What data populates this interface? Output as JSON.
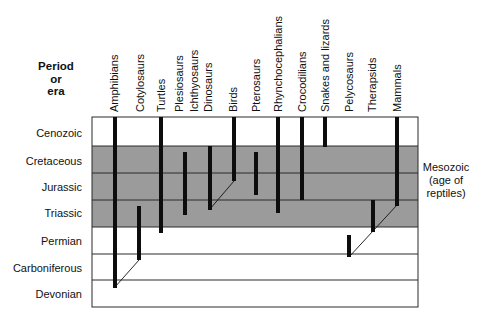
{
  "header": {
    "lines": [
      "Period",
      "or",
      "era"
    ]
  },
  "colors": {
    "mesozoic_band": "#9b9b9b",
    "grid_line": "#2a2a2a",
    "bar": "#0d0d0d",
    "background": "#ffffff"
  },
  "periods": [
    {
      "name": "Cenozoic",
      "y_center": 133
    },
    {
      "name": "Cretaceous",
      "y_center": 161
    },
    {
      "name": "Jurassic",
      "y_center": 187
    },
    {
      "name": "Triassic",
      "y_center": 213
    },
    {
      "name": "Permian",
      "y_center": 241
    },
    {
      "name": "Carboniferous",
      "y_center": 268
    },
    {
      "name": "Devonian",
      "y_center": 294
    }
  ],
  "era_annotation": {
    "lines": [
      "Mesozoic",
      "(age of",
      "reptiles)"
    ],
    "spans_periods": [
      "Cretaceous",
      "Jurassic",
      "Triassic"
    ]
  },
  "taxa": [
    {
      "name": "Amphibians",
      "x": 115,
      "from": "Devonian",
      "to": "Cenozoic (present)"
    },
    {
      "name": "Cotylosaurs",
      "x": 139,
      "from": "Carboniferous",
      "to": "Triassic"
    },
    {
      "name": "Turtles",
      "x": 161,
      "from": "Permian",
      "to": "Cenozoic (present)"
    },
    {
      "name": "Plesiosaurs",
      "x": 178,
      "from": "",
      "to": ""
    },
    {
      "name": "Ichthyosaurs",
      "x": 185,
      "from": "Triassic",
      "to": "Cretaceous"
    },
    {
      "name": "Dinosaurs",
      "x": 210,
      "from": "Triassic",
      "to": "Cretaceous"
    },
    {
      "name": "Birds",
      "x": 234,
      "from": "Jurassic",
      "to": "Cenozoic (present)"
    },
    {
      "name": "Pterosaurs",
      "x": 256,
      "from": "Jurassic",
      "to": "Cretaceous"
    },
    {
      "name": "Rhynchocephalians",
      "x": 278,
      "from": "Triassic",
      "to": "Cenozoic (present)"
    },
    {
      "name": "Crocodilians",
      "x": 302,
      "from": "Jurassic",
      "to": "Cenozoic (present)"
    },
    {
      "name": "Snakes and lizards",
      "x": 325,
      "from": "Cretaceous",
      "to": "Cenozoic (present)"
    },
    {
      "name": "Pelycosaurs",
      "x": 349,
      "from": "Carboniferous",
      "to": "Permian"
    },
    {
      "name": "Therapsids",
      "x": 373,
      "from": "Permian",
      "to": "Triassic"
    },
    {
      "name": "Mammals",
      "x": 397,
      "from": "Triassic",
      "to": "Cenozoic (present)"
    }
  ],
  "labels": {
    "amphibians": "Amphibians",
    "cotylosaurs": "Cotylosaurs",
    "turtles": "Turtles",
    "plesiosaurs": "Plesiosaurs",
    "ichthyosaurs": "Ichthyosaurs",
    "dinosaurs": "Dinosaurs",
    "birds": "Birds",
    "pterosaurs": "Pterosaurs",
    "rhynchocephalians": "Rhynchocephalians",
    "crocodilians": "Crocodilians",
    "snakes": "Snakes and lizards",
    "pelycosaurs": "Pelycosaurs",
    "therapsids": "Therapsids",
    "mammals": "Mammals"
  },
  "lineage_links": [
    {
      "from": "Amphibians",
      "to": "Cotylosaurs"
    },
    {
      "from": "Dinosaurs",
      "to": "Birds"
    },
    {
      "from": "Pelycosaurs",
      "to": "Therapsids"
    },
    {
      "from": "Therapsids",
      "to": "Mammals"
    }
  ]
}
